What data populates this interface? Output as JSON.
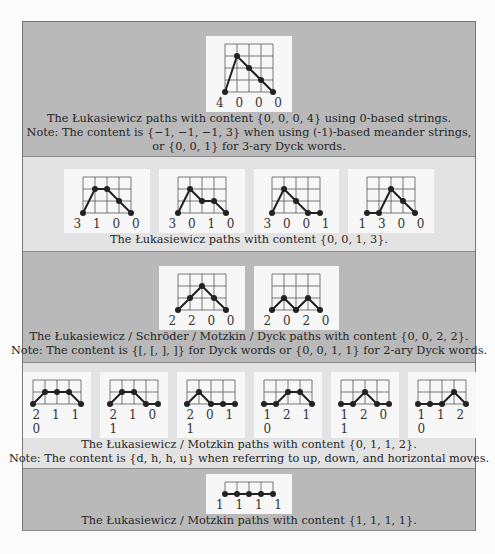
{
  "colors": {
    "panel_dark": "#b9b9b9",
    "panel_light": "#e3e3e3",
    "card": "#f7f7f7",
    "path": "#222222",
    "grid": "#444444"
  },
  "panels": [
    {
      "shade": "dark",
      "height": 135,
      "pad_top": 14,
      "cards": [
        {
          "code": "4 0 0 0",
          "grid_rows": 4,
          "heights": [
            0,
            3,
            2,
            1,
            0
          ]
        }
      ],
      "captions": [
        "The Łukasiewicz paths with content {0, 0, 0, 4} using 0-based strings.",
        "Note: The content is {−1, −1, −1, 3} when using (-1)-based meander strings,",
        "or {0, 0, 1} for 3-ary Dyck words."
      ]
    },
    {
      "shade": "light",
      "height": 95,
      "pad_top": 12,
      "cards": [
        {
          "code": "3 1 0 0",
          "grid_rows": 3,
          "heights": [
            0,
            2,
            2,
            1,
            0
          ]
        },
        {
          "code": "3 0 1 0",
          "grid_rows": 3,
          "heights": [
            0,
            2,
            1,
            1,
            0
          ]
        },
        {
          "code": "3 0 0 1",
          "grid_rows": 3,
          "heights": [
            0,
            2,
            1,
            0,
            0
          ]
        },
        {
          "code": "1 3 0 0",
          "grid_rows": 3,
          "heights": [
            0,
            0,
            2,
            1,
            0
          ]
        }
      ],
      "captions": [
        "The Łukasiewicz paths with content {0, 0, 1, 3}."
      ]
    },
    {
      "shade": "dark",
      "height": 111,
      "pad_top": 14,
      "cards": [
        {
          "code": "2 2 0 0",
          "grid_rows": 3,
          "heights": [
            0,
            1,
            2,
            1,
            0
          ]
        },
        {
          "code": "2 0 2 0",
          "grid_rows": 3,
          "heights": [
            0,
            1,
            0,
            1,
            0
          ]
        }
      ],
      "captions": [
        "The Łukasiewicz / Schröder / Motzkin / Dyck paths with content {0, 0, 2, 2}.",
        "Note: The content is {[, [, ], ]} for Dyck words or {0, 0, 1, 1} for 2-ary Dyck words."
      ]
    },
    {
      "shade": "light",
      "height": 106,
      "pad_top": 9,
      "cards": [
        {
          "code": "2 1 1 0",
          "grid_rows": 2,
          "heights": [
            0,
            1,
            1,
            1,
            0
          ]
        },
        {
          "code": "2 1 0 1",
          "grid_rows": 2,
          "heights": [
            0,
            1,
            1,
            0,
            0
          ]
        },
        {
          "code": "2 0 1 1",
          "grid_rows": 2,
          "heights": [
            0,
            1,
            0,
            0,
            0
          ]
        },
        {
          "code": "1 2 1 0",
          "grid_rows": 2,
          "heights": [
            0,
            0,
            1,
            1,
            0
          ]
        },
        {
          "code": "1 2 0 1",
          "grid_rows": 2,
          "heights": [
            0,
            0,
            1,
            0,
            0
          ]
        },
        {
          "code": "1 1 2 0",
          "grid_rows": 2,
          "heights": [
            0,
            0,
            0,
            1,
            0
          ]
        }
      ],
      "captions": [
        "The Łukasiewicz / Motzkin paths with content {0, 1, 1, 2}.",
        "Note: The content is {d, h, h, u} when referring to up, down, and horizontal moves."
      ]
    },
    {
      "shade": "dark",
      "height": 61,
      "pad_top": 5,
      "cards": [
        {
          "code": "1 1 1 1",
          "grid_rows": 1,
          "heights": [
            0,
            0,
            0,
            0,
            0
          ]
        }
      ],
      "captions": [
        "The Łukasiewicz / Motzkin paths with content {1, 1, 1, 1}."
      ]
    }
  ]
}
